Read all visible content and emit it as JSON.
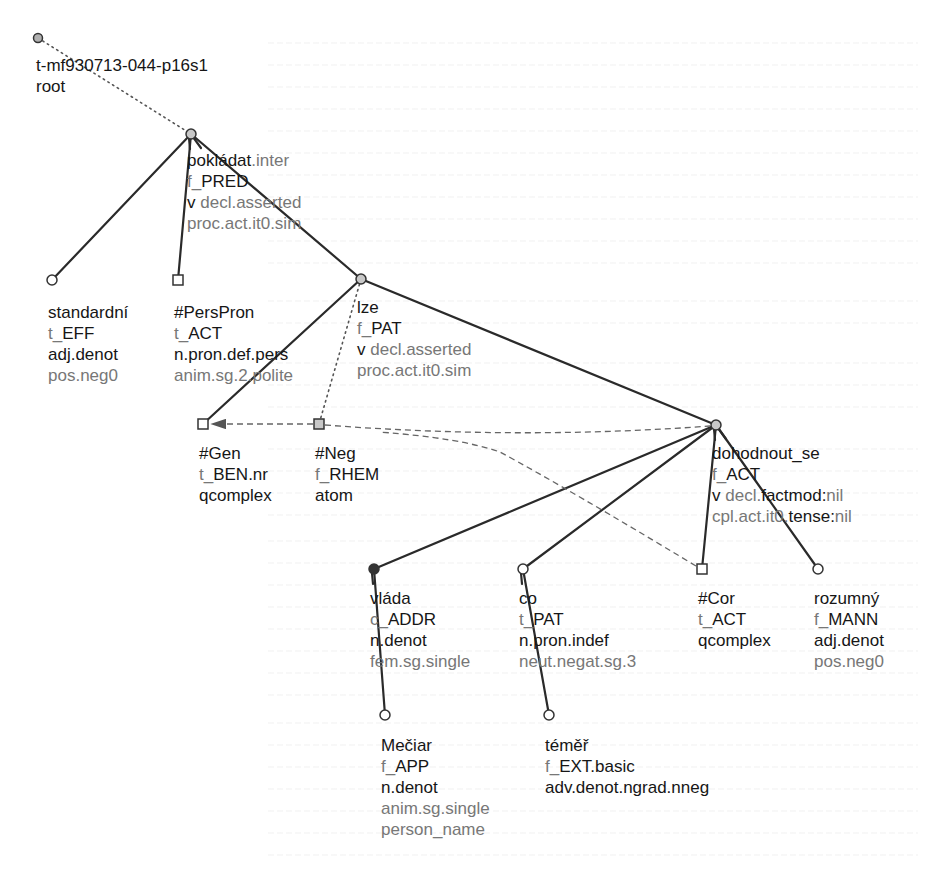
{
  "tree": {
    "id_label": "t-mf930713-044-p16s1",
    "root_label": "root",
    "colors": {
      "dark_text": "#161616",
      "grey_text": "#777777",
      "edge": "#2a2a2a",
      "node_fill_grey": "#b0b0b0",
      "node_fill_dark": "#333333"
    },
    "nodes": [
      {
        "key": "root",
        "x": 38,
        "y": 38,
        "shape": "circle",
        "fill": "#b0b0b0",
        "label_x": 36,
        "label_y": 55,
        "lines": [
          [
            [
              "t-mf930713-044-p16s1",
              "dark"
            ]
          ],
          [
            [
              "root",
              "dark"
            ]
          ]
        ]
      },
      {
        "key": "pokladat",
        "x": 191,
        "y": 134,
        "shape": "circle",
        "fill": "#c8c8c8",
        "label_x": 187,
        "label_y": 150,
        "lines": [
          [
            [
              "pokládat",
              "dark"
            ],
            [
              ".inter",
              "grey"
            ]
          ],
          [
            [
              "f_",
              "grey"
            ],
            [
              "PRED",
              "dark"
            ]
          ],
          [
            [
              "v ",
              "dark"
            ],
            [
              "decl.asserted",
              "grey"
            ]
          ],
          [
            [
              "proc.act.it0.sim",
              "grey"
            ]
          ]
        ]
      },
      {
        "key": "standardni",
        "x": 52,
        "y": 280,
        "shape": "circle",
        "fill": "#ffffff",
        "label_x": 48,
        "label_y": 302,
        "lines": [
          [
            [
              "standardní",
              "dark"
            ]
          ],
          [
            [
              "t_",
              "grey"
            ],
            [
              "EFF",
              "dark"
            ]
          ],
          [
            [
              "adj.denot",
              "dark"
            ]
          ],
          [
            [
              "pos.neg0",
              "grey"
            ]
          ]
        ]
      },
      {
        "key": "perspron",
        "x": 178,
        "y": 280,
        "shape": "square",
        "fill": "#ffffff",
        "label_x": 174,
        "label_y": 302,
        "lines": [
          [
            [
              "#PersPron",
              "dark"
            ]
          ],
          [
            [
              "t_",
              "grey"
            ],
            [
              "ACT",
              "dark"
            ]
          ],
          [
            [
              "n.pron.def.pers",
              "dark"
            ]
          ],
          [
            [
              "anim.sg.2.polite",
              "grey"
            ]
          ]
        ]
      },
      {
        "key": "lze",
        "x": 361,
        "y": 279,
        "shape": "circle",
        "fill": "#c8c8c8",
        "label_x": 357,
        "label_y": 297,
        "lines": [
          [
            [
              "lze",
              "dark"
            ]
          ],
          [
            [
              "f_",
              "grey"
            ],
            [
              "PAT",
              "dark"
            ]
          ],
          [
            [
              "v ",
              "dark"
            ],
            [
              "decl.asserted",
              "grey"
            ]
          ],
          [
            [
              "proc.act.it0.sim",
              "grey"
            ]
          ]
        ]
      },
      {
        "key": "gen",
        "x": 203,
        "y": 424,
        "shape": "square",
        "fill": "#ffffff",
        "label_x": 199,
        "label_y": 443,
        "lines": [
          [
            [
              "#Gen",
              "dark"
            ]
          ],
          [
            [
              "t_",
              "grey"
            ],
            [
              "BEN.nr",
              "dark"
            ]
          ],
          [
            [
              "qcomplex",
              "dark"
            ]
          ]
        ]
      },
      {
        "key": "neg",
        "x": 319,
        "y": 424,
        "shape": "square",
        "fill": "#c8c8c8",
        "label_x": 315,
        "label_y": 443,
        "lines": [
          [
            [
              "#Neg",
              "dark"
            ]
          ],
          [
            [
              "f_",
              "grey"
            ],
            [
              "RHEM",
              "dark"
            ]
          ],
          [
            [
              "atom",
              "dark"
            ]
          ]
        ]
      },
      {
        "key": "dohodnout",
        "x": 716,
        "y": 425,
        "shape": "circle",
        "fill": "#c8c8c8",
        "label_x": 712,
        "label_y": 443,
        "lines": [
          [
            [
              "dohodnout_se",
              "dark"
            ]
          ],
          [
            [
              "f_",
              "grey"
            ],
            [
              "ACT",
              "dark"
            ]
          ],
          [
            [
              "v ",
              "dark"
            ],
            [
              "decl.",
              "grey"
            ],
            [
              "factmod:",
              "dark"
            ],
            [
              "nil",
              "grey"
            ]
          ],
          [
            [
              "cpl.act.it0.",
              "grey"
            ],
            [
              "tense:",
              "dark"
            ],
            [
              "nil",
              "grey"
            ]
          ]
        ]
      },
      {
        "key": "vlada",
        "x": 374,
        "y": 569,
        "shape": "circle",
        "fill": "#333333",
        "label_x": 370,
        "label_y": 588,
        "lines": [
          [
            [
              "vláda",
              "dark"
            ]
          ],
          [
            [
              "c_",
              "grey"
            ],
            [
              "ADDR",
              "dark"
            ]
          ],
          [
            [
              "n.denot",
              "dark"
            ]
          ],
          [
            [
              "fem.sg.single",
              "grey"
            ]
          ]
        ]
      },
      {
        "key": "co",
        "x": 523,
        "y": 569,
        "shape": "circle",
        "fill": "#ffffff",
        "label_x": 519,
        "label_y": 588,
        "lines": [
          [
            [
              "co",
              "dark"
            ]
          ],
          [
            [
              "t_",
              "grey"
            ],
            [
              "PAT",
              "dark"
            ]
          ],
          [
            [
              "n.pron.indef",
              "dark"
            ]
          ],
          [
            [
              "neut.negat.sg.3",
              "grey"
            ]
          ]
        ]
      },
      {
        "key": "cor",
        "x": 702,
        "y": 569,
        "shape": "square",
        "fill": "#ffffff",
        "label_x": 698,
        "label_y": 588,
        "lines": [
          [
            [
              "#Cor",
              "dark"
            ]
          ],
          [
            [
              "t_",
              "grey"
            ],
            [
              "ACT",
              "dark"
            ]
          ],
          [
            [
              "qcomplex",
              "dark"
            ]
          ]
        ]
      },
      {
        "key": "rozumny",
        "x": 818,
        "y": 569,
        "shape": "circle",
        "fill": "#ffffff",
        "label_x": 814,
        "label_y": 588,
        "lines": [
          [
            [
              "rozumný",
              "dark"
            ]
          ],
          [
            [
              "f_",
              "grey"
            ],
            [
              "MANN",
              "dark"
            ]
          ],
          [
            [
              "adj.denot",
              "dark"
            ]
          ],
          [
            [
              "pos.neg0",
              "grey"
            ]
          ]
        ]
      },
      {
        "key": "meciar",
        "x": 385,
        "y": 715,
        "shape": "circle",
        "fill": "#ffffff",
        "label_x": 381,
        "label_y": 735,
        "lines": [
          [
            [
              "Mečiar",
              "dark"
            ]
          ],
          [
            [
              "f_",
              "grey"
            ],
            [
              "APP",
              "dark"
            ]
          ],
          [
            [
              "n.denot",
              "dark"
            ]
          ],
          [
            [
              "anim.sg.single",
              "grey"
            ]
          ],
          [
            [
              "person_name",
              "grey"
            ]
          ]
        ]
      },
      {
        "key": "temer",
        "x": 549,
        "y": 715,
        "shape": "circle",
        "fill": "#ffffff",
        "label_x": 545,
        "label_y": 735,
        "lines": [
          [
            [
              "téměř",
              "dark"
            ]
          ],
          [
            [
              "f_",
              "grey"
            ],
            [
              "EXT.basic",
              "dark"
            ]
          ],
          [
            [
              "adv.denot.ngrad.nneg",
              "dark"
            ]
          ]
        ]
      }
    ],
    "edges": [
      {
        "from": "root",
        "to": "pokladat",
        "style": "dotted"
      },
      {
        "from": "pokladat",
        "to": "standardni",
        "style": "solid"
      },
      {
        "from": "pokladat",
        "to": "perspron",
        "style": "solid"
      },
      {
        "from": "pokladat",
        "to": "lze",
        "style": "solid"
      },
      {
        "from": "lze",
        "to": "gen",
        "style": "solid"
      },
      {
        "from": "lze",
        "to": "neg",
        "style": "dotted"
      },
      {
        "from": "lze",
        "to": "dohodnout",
        "style": "solid"
      },
      {
        "from": "dohodnout",
        "to": "vlada",
        "style": "solid"
      },
      {
        "from": "dohodnout",
        "to": "co",
        "style": "solid"
      },
      {
        "from": "dohodnout",
        "to": "cor",
        "style": "solid"
      },
      {
        "from": "dohodnout",
        "to": "rozumny",
        "style": "solid"
      },
      {
        "from": "vlada",
        "to": "meciar",
        "style": "solid"
      },
      {
        "from": "co",
        "to": "temer",
        "style": "solid"
      }
    ],
    "coref_arrows": [
      {
        "from": "neg",
        "to": "gen",
        "style": "dashed",
        "arrow": true
      },
      {
        "from": "dohodnout",
        "to": "neg",
        "style": "dashed",
        "curve": true
      },
      {
        "from": "cor",
        "to": "lze_area",
        "style": "dashed",
        "note": "coreference arc from #Cor toward upper-left"
      }
    ]
  }
}
